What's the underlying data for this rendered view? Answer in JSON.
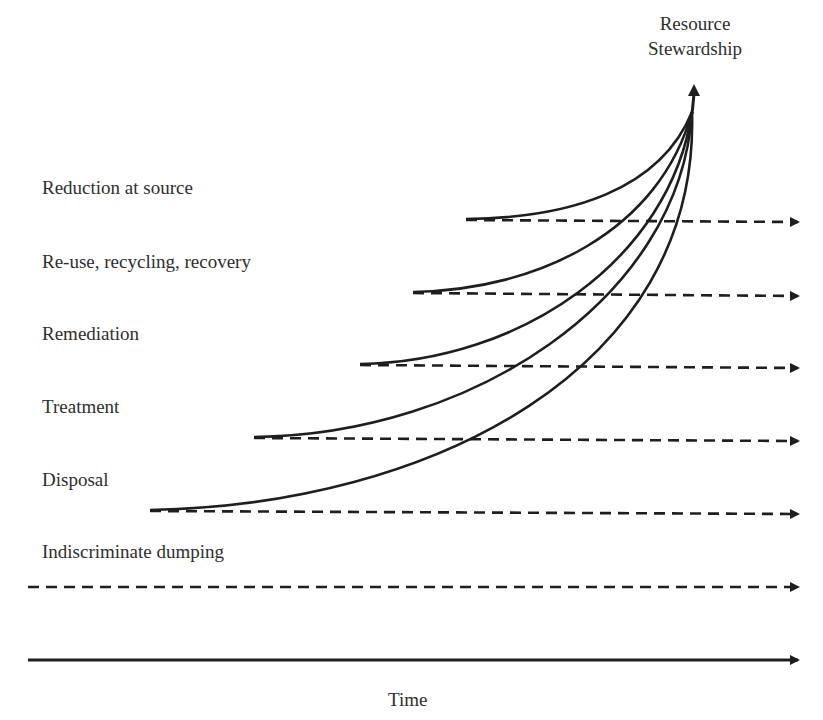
{
  "diagram": {
    "top_label": {
      "line1": "Resource",
      "line2": "Stewardship"
    },
    "x_axis_label": "Time",
    "levels": [
      {
        "label": "Reduction at source",
        "label_y": 177,
        "line_y": 220,
        "curve_start_x": 466
      },
      {
        "label": "Re-use, recycling, recovery",
        "label_y": 251,
        "line_y": 294,
        "curve_start_x": 413
      },
      {
        "label": "Remediation",
        "label_y": 323,
        "line_y": 366,
        "curve_start_x": 360
      },
      {
        "label": "Treatment",
        "label_y": 396,
        "line_y": 439,
        "curve_start_x": 254
      },
      {
        "label": "Disposal",
        "label_y": 469,
        "line_y": 512,
        "curve_start_x": 150
      },
      {
        "label": "Indiscriminate dumping",
        "label_y": 541,
        "line_y": 587,
        "curve_start_x": null
      }
    ],
    "apex": {
      "x": 692,
      "y": 110
    },
    "arrow_end_x": 800,
    "colors": {
      "stroke": "#1e1e1e",
      "text": "#2e2e2e",
      "background": "#ffffff"
    }
  }
}
